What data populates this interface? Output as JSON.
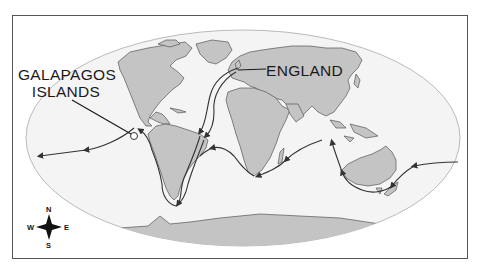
{
  "map": {
    "type": "world-route-map",
    "projection": "elliptical (Mollweide-style)",
    "colors": {
      "background": "#ffffff",
      "frame": "#555555",
      "ocean": "#f4f4f4",
      "land": "#c4c4c4",
      "coastline": "#555555",
      "route": "#333333",
      "label_text": "#1a1a1a"
    },
    "labels": {
      "galapagos_line1": "GALAPAGOS",
      "galapagos_line2": "ISLANDS",
      "england": "ENGLAND"
    },
    "compass": {
      "north": "N",
      "south": "S",
      "east": "E",
      "west": "W"
    },
    "route_description": "Voyage route with arrows from England, down Atlantic to South America, around Cape Horn, to Galapagos Islands, across Pacific, around Australia, across Indian Ocean, around Cape of Good Hope, back to South America and England"
  }
}
